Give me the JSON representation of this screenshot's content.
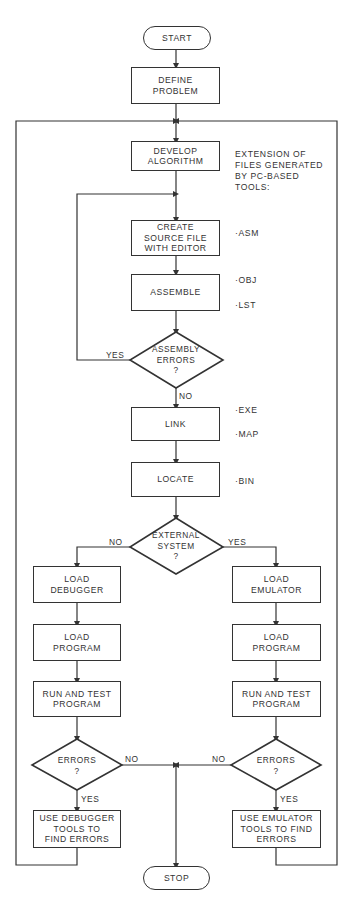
{
  "diagram": {
    "type": "flowchart",
    "title": "",
    "nodes": {
      "start": "START",
      "define": "DEFINE\nPROBLEM",
      "develop": "DEVELOP\nALGORITHM",
      "create": "CREATE\nSOURCE FILE\nWITH EDITOR",
      "assemble": "ASSEMBLE",
      "asm_errors": "ASSEMBLY\nERRORS\n?",
      "link": "LINK",
      "locate": "LOCATE",
      "external": "EXTERNAL\nSYSTEM\n?",
      "load_debugger": "LOAD\nDEBUGGER",
      "load_program_left": "LOAD\nPROGRAM",
      "run_test_left": "RUN AND TEST\nPROGRAM",
      "errors_left": "ERRORS\n?",
      "use_debugger": "USE DEBUGGER\nTOOLS TO\nFIND ERRORS",
      "load_emulator": "LOAD\nEMULATOR",
      "load_program_right": "LOAD\nPROGRAM",
      "run_test_right": "RUN AND TEST\nPROGRAM",
      "errors_right": "ERRORS\n?",
      "use_emulator": "USE EMULATOR\nTOOLS TO FIND\nERRORS",
      "stop": "STOP"
    },
    "edge_labels": {
      "asm_yes": "YES",
      "asm_no": "NO",
      "ext_no": "NO",
      "ext_yes": "YES",
      "err_left_no": "NO",
      "err_left_yes": "YES",
      "err_right_no": "NO",
      "err_right_yes": "YES"
    },
    "annotation": {
      "heading": "EXTENSION OF\nFILES GENERATED\nBY PC-BASED\nTOOLS:",
      "extensions": {
        "asm": "·ASM",
        "obj": "·OBJ",
        "lst": "·LST",
        "exe": "·EXE",
        "map": "·MAP",
        "bin": "·BIN"
      }
    },
    "edges": [
      [
        "start",
        "define"
      ],
      [
        "define",
        "develop"
      ],
      [
        "develop",
        "create"
      ],
      [
        "create",
        "assemble"
      ],
      [
        "assemble",
        "asm_errors"
      ],
      [
        "asm_errors",
        "create",
        "YES"
      ],
      [
        "asm_errors",
        "link",
        "NO"
      ],
      [
        "link",
        "locate"
      ],
      [
        "locate",
        "external"
      ],
      [
        "external",
        "load_debugger",
        "NO"
      ],
      [
        "external",
        "load_emulator",
        "YES"
      ],
      [
        "load_debugger",
        "load_program_left"
      ],
      [
        "load_program_left",
        "run_test_left"
      ],
      [
        "run_test_left",
        "errors_left"
      ],
      [
        "errors_left",
        "use_debugger",
        "YES"
      ],
      [
        "errors_left",
        "stop",
        "NO"
      ],
      [
        "use_debugger",
        "develop"
      ],
      [
        "load_emulator",
        "load_program_right"
      ],
      [
        "load_program_right",
        "run_test_right"
      ],
      [
        "run_test_right",
        "errors_right"
      ],
      [
        "errors_right",
        "use_emulator",
        "YES"
      ],
      [
        "errors_right",
        "stop",
        "NO"
      ],
      [
        "use_emulator",
        "develop"
      ]
    ],
    "colors": {
      "line": "#333333",
      "background": "#ffffff"
    }
  }
}
